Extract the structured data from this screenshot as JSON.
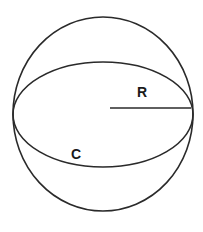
{
  "diagram": {
    "labels": {
      "radius": "R",
      "circumference": "C"
    },
    "colors": {
      "stroke": "#2a2a2a",
      "background": "#ffffff"
    },
    "shapes": {
      "sphere_outline": {
        "cx": 103,
        "cy": 114,
        "rx": 90,
        "ry": 97
      },
      "great_circle": {
        "cx": 103,
        "cy": 114.5,
        "rx": 90,
        "ry": 52.5
      },
      "radius_line": {
        "x1": 110,
        "y1": 108,
        "x2": 191,
        "y2": 108
      }
    }
  }
}
